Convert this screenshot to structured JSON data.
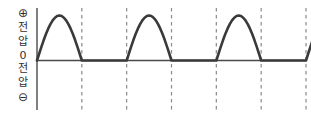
{
  "figure": {
    "title": "",
    "axis_labels": {
      "positive_sign": "⊕",
      "positive_voltage_line1": "전",
      "positive_voltage_line2": "압",
      "zero": "0",
      "negative_voltage_line1": "전",
      "negative_voltage_line2": "압",
      "negative_sign": "⊖"
    },
    "colors": {
      "waveform": "#3a3a3a",
      "axis": "#4a4a4a",
      "dashed_marker": "#8a8a8a",
      "background": "#ffffff",
      "text": "#2f2f2f"
    }
  },
  "chart_data": {
    "type": "line",
    "title": "",
    "subtitle": "",
    "xlabel": "",
    "ylabel": "전압",
    "waveform_name": "half-wave rectified sine",
    "xlim": [
      0,
      6
    ],
    "ylim": [
      -1,
      1
    ],
    "grid": false,
    "legend": null,
    "baseline_value": 0,
    "peak_value": 1,
    "period_units": 1,
    "number_of_full_humps": 3,
    "partial_hump_at_end": true,
    "dashed_marker_x": [
      1,
      2,
      3,
      4,
      5,
      6
    ],
    "series": [
      {
        "name": "전압",
        "x": [
          0.0,
          0.05,
          0.1,
          0.15,
          0.2,
          0.25,
          0.3,
          0.35,
          0.4,
          0.45,
          0.5,
          0.55,
          0.6,
          0.65,
          0.7,
          0.75,
          0.8,
          0.85,
          0.9,
          0.95,
          1.0,
          1.5,
          2.0,
          2.05,
          2.1,
          2.15,
          2.2,
          2.25,
          2.3,
          2.35,
          2.4,
          2.45,
          2.5,
          2.55,
          2.6,
          2.65,
          2.7,
          2.75,
          2.8,
          2.85,
          2.9,
          2.95,
          3.0,
          3.5,
          4.0,
          4.05,
          4.1,
          4.15,
          4.2,
          4.25,
          4.3,
          4.35,
          4.4,
          4.45,
          4.5,
          4.55,
          4.6,
          4.65,
          4.7,
          4.75,
          4.8,
          4.85,
          4.9,
          4.95,
          5.0,
          5.5,
          6.0,
          6.05,
          6.1,
          6.15,
          6.2
        ],
        "y": [
          0.0,
          0.156,
          0.309,
          0.454,
          0.588,
          0.707,
          0.809,
          0.891,
          0.951,
          0.988,
          1.0,
          0.988,
          0.951,
          0.891,
          0.809,
          0.707,
          0.588,
          0.454,
          0.309,
          0.156,
          0.0,
          0.0,
          0.0,
          0.156,
          0.309,
          0.454,
          0.588,
          0.707,
          0.809,
          0.891,
          0.951,
          0.988,
          1.0,
          0.988,
          0.951,
          0.891,
          0.809,
          0.707,
          0.588,
          0.454,
          0.309,
          0.156,
          0.0,
          0.0,
          0.0,
          0.156,
          0.309,
          0.454,
          0.588,
          0.707,
          0.809,
          0.891,
          0.951,
          0.988,
          1.0,
          0.988,
          0.951,
          0.891,
          0.809,
          0.707,
          0.588,
          0.454,
          0.309,
          0.156,
          0.0,
          0.0,
          0.0,
          0.156,
          0.309,
          0.454,
          0.588
        ]
      }
    ]
  }
}
